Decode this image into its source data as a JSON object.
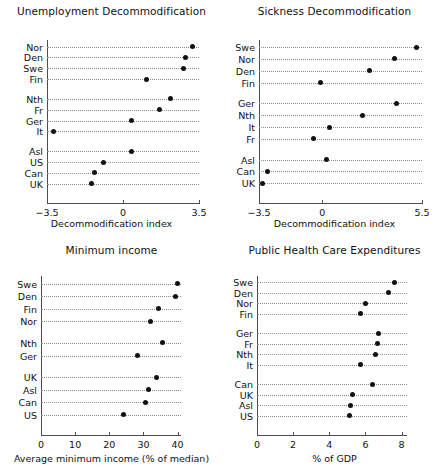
{
  "chart_data": [
    {
      "type": "scatter",
      "title": "Unemployment Decommodification",
      "xlabel": "Decommodification index",
      "ylabel": "",
      "xlim": [
        -3.5,
        3.5
      ],
      "xticks": [
        -3.5,
        0,
        3.5
      ],
      "xticklabels": [
        "−3.5",
        "0",
        "3.5"
      ],
      "grid": true,
      "orientation": "horizontal-dot",
      "groups": [
        {
          "rows": [
            {
              "label": "Nor",
              "value": 3.2
            },
            {
              "label": "Den",
              "value": 2.9
            },
            {
              "label": "Swe",
              "value": 2.8
            },
            {
              "label": "Fin",
              "value": 1.1
            }
          ]
        },
        {
          "rows": [
            {
              "label": "Nth",
              "value": 2.2
            },
            {
              "label": "Fr",
              "value": 1.7
            },
            {
              "label": "Ger",
              "value": 0.4
            },
            {
              "label": "It",
              "value": -3.2
            }
          ]
        },
        {
          "rows": [
            {
              "label": "Asl",
              "value": 0.4
            },
            {
              "label": "US",
              "value": -0.9
            },
            {
              "label": "Can",
              "value": -1.3
            },
            {
              "label": "UK",
              "value": -1.45
            }
          ]
        }
      ]
    },
    {
      "type": "scatter",
      "title": "Sickness Decommodification",
      "xlabel": "Decommodification index",
      "ylabel": "",
      "xlim": [
        -3.5,
        5.5
      ],
      "xticks": [
        -3.5,
        0,
        5.5
      ],
      "xticklabels": [
        "−3.5",
        "0",
        "5.5"
      ],
      "grid": true,
      "orientation": "horizontal-dot",
      "groups": [
        {
          "rows": [
            {
              "label": "Swe",
              "value": 5.2
            },
            {
              "label": "Nor",
              "value": 4.0
            },
            {
              "label": "Den",
              "value": 2.6
            },
            {
              "label": "Fin",
              "value": -0.1
            }
          ]
        },
        {
          "rows": [
            {
              "label": "Ger",
              "value": 4.1
            },
            {
              "label": "Nth",
              "value": 2.2
            },
            {
              "label": "It",
              "value": 0.4
            },
            {
              "label": "Fr",
              "value": -0.5
            }
          ]
        },
        {
          "rows": [
            {
              "label": "Asl",
              "value": 0.2
            },
            {
              "label": "Can",
              "value": -3.05
            },
            {
              "label": "UK",
              "value": -3.3
            }
          ]
        }
      ]
    },
    {
      "type": "scatter",
      "title": "Minimum income",
      "xlabel": "Average minimum income (% of median)",
      "ylabel": "",
      "xlim": [
        0,
        41
      ],
      "xticks": [
        0,
        10,
        20,
        30,
        40
      ],
      "xticklabels": [
        "0",
        "10",
        "20",
        "30",
        "40"
      ],
      "grid": true,
      "orientation": "horizontal-dot",
      "groups": [
        {
          "rows": [
            {
              "label": "Swe",
              "value": 40.0
            },
            {
              "label": "Den",
              "value": 39.5
            },
            {
              "label": "Fin",
              "value": 34.5
            },
            {
              "label": "Nor",
              "value": 32.0
            }
          ]
        },
        {
          "rows": [
            {
              "label": "Nth",
              "value": 35.5
            },
            {
              "label": "Ger",
              "value": 28.2
            }
          ]
        },
        {
          "rows": [
            {
              "label": "UK",
              "value": 33.8
            },
            {
              "label": "Asl",
              "value": 31.5
            },
            {
              "label": "Can",
              "value": 30.6
            },
            {
              "label": "US",
              "value": 24.2
            }
          ]
        }
      ]
    },
    {
      "type": "scatter",
      "title": "Public Health Care Expenditures",
      "xlabel": "% of GDP",
      "ylabel": "",
      "xlim": [
        0,
        8.3
      ],
      "xticks": [
        0,
        2,
        4,
        6,
        8
      ],
      "xticklabels": [
        "0",
        "2",
        "4",
        "6",
        "8"
      ],
      "grid": true,
      "orientation": "horizontal-dot",
      "groups": [
        {
          "rows": [
            {
              "label": "Swe",
              "value": 7.6
            },
            {
              "label": "Den",
              "value": 7.3
            },
            {
              "label": "Nor",
              "value": 6.0
            },
            {
              "label": "Fin",
              "value": 5.75
            }
          ]
        },
        {
          "rows": [
            {
              "label": "Ger",
              "value": 6.75
            },
            {
              "label": "Fr",
              "value": 6.65
            },
            {
              "label": "Nth",
              "value": 6.55
            },
            {
              "label": "It",
              "value": 5.7
            }
          ]
        },
        {
          "rows": [
            {
              "label": "Can",
              "value": 6.4
            },
            {
              "label": "UK",
              "value": 5.3
            },
            {
              "label": "Asl",
              "value": 5.2
            },
            {
              "label": "US",
              "value": 5.1
            }
          ]
        }
      ]
    }
  ],
  "layout": {
    "panels": [
      {
        "plot_left": 47,
        "plot_top": 40,
        "plot_width": 152,
        "plot_height": 164,
        "title_top": 5,
        "xlabel_top": 218,
        "group_gap": 9
      },
      {
        "plot_left": 36,
        "plot_top": 40,
        "plot_width": 163,
        "plot_height": 164,
        "title_top": 5,
        "xlabel_top": 218,
        "group_gap": 9
      },
      {
        "plot_left": 41,
        "plot_top": 38,
        "plot_width": 140,
        "plot_height": 160,
        "title_top": 6,
        "xlabel_top": 215,
        "group_gap": 9
      },
      {
        "plot_left": 34,
        "plot_top": 38,
        "plot_width": 150,
        "plot_height": 160,
        "title_top": 6,
        "xlabel_top": 215,
        "group_gap": 9
      }
    ]
  }
}
